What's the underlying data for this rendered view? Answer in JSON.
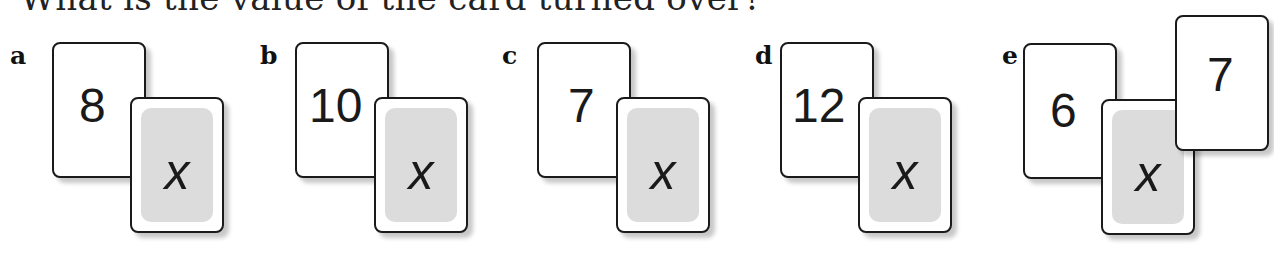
{
  "title": "What is the value of the card turned over?",
  "unknown_symbol": "x",
  "problems": [
    {
      "label": "a",
      "cards": [
        "8"
      ]
    },
    {
      "label": "b",
      "cards": [
        "10"
      ]
    },
    {
      "label": "c",
      "cards": [
        "7"
      ]
    },
    {
      "label": "d",
      "cards": [
        "12"
      ]
    },
    {
      "label": "e",
      "cards": [
        "6",
        "7"
      ]
    }
  ]
}
